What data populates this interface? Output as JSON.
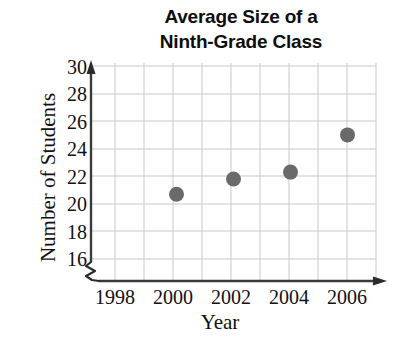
{
  "chart_data": {
    "type": "scatter",
    "title_line1": "Average Size of a",
    "title_line2": "Ninth-Grade Class",
    "xlabel": "Year",
    "ylabel": "Number of Students",
    "x": [
      2000,
      2002,
      2004,
      2006
    ],
    "values": [
      20.7,
      21.8,
      22.3,
      25.0
    ],
    "points": [
      {
        "year": 2000,
        "students": 20.7
      },
      {
        "year": 2002,
        "students": 21.8
      },
      {
        "year": 2004,
        "students": 22.3
      },
      {
        "year": 2006,
        "students": 25.0
      }
    ],
    "xticks": [
      "1998",
      "2000",
      "2002",
      "2004",
      "2006"
    ],
    "xtick_values": [
      1998,
      2000,
      2002,
      2004,
      2006
    ],
    "yticks": [
      "16",
      "18",
      "20",
      "22",
      "24",
      "26",
      "28",
      "30"
    ],
    "ytick_values": [
      16,
      18,
      20,
      22,
      24,
      26,
      28,
      30
    ],
    "xlim": [
      1997,
      2007
    ],
    "ylim": [
      16,
      30
    ],
    "grid": true,
    "legend": false,
    "axis_break_y": true,
    "axis_break_x": true,
    "marker_color": "#6a6a6a",
    "grid_color": "#c8c8c8",
    "axis_color": "#333333"
  }
}
